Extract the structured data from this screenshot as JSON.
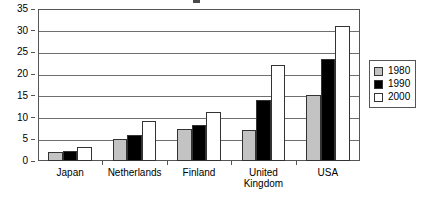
{
  "chart_data": {
    "type": "bar",
    "title": "",
    "xlabel": "",
    "ylabel": "",
    "ylim": [
      0,
      35
    ],
    "ytick_step": 5,
    "yticks": [
      "0",
      "5",
      "10",
      "15",
      "20",
      "25",
      "30",
      "35"
    ],
    "grid": true,
    "legend_position": "right",
    "categories": [
      "Japan",
      "Netherlands",
      "Finland",
      "United\nKingdom",
      "USA"
    ],
    "series": [
      {
        "name": "1980",
        "color": "#c3c3c3",
        "values": [
          2.0,
          5.0,
          7.4,
          7.1,
          15.2
        ]
      },
      {
        "name": "1990",
        "color": "#000000",
        "values": [
          2.3,
          6.1,
          8.3,
          14.0,
          23.5
        ]
      },
      {
        "name": "2000",
        "color": "#ffffff",
        "values": [
          3.2,
          9.3,
          11.3,
          22.1,
          31.0
        ]
      }
    ]
  },
  "legend": {
    "items": [
      {
        "label": "1980"
      },
      {
        "label": "1990"
      },
      {
        "label": "2000"
      }
    ]
  }
}
